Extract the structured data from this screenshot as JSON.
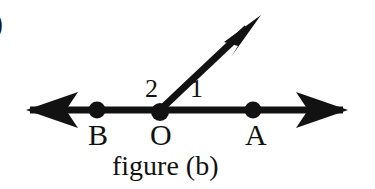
{
  "figure": {
    "caption": "figure (b)",
    "corner_mark": ")",
    "background_color": "#ffffff",
    "ink_color": "#121212",
    "points": [
      {
        "id": "B",
        "label": "B",
        "x": 97,
        "y": 110
      },
      {
        "id": "O",
        "label": "O",
        "x": 160,
        "y": 110
      },
      {
        "id": "A",
        "label": "A",
        "x": 253,
        "y": 110
      }
    ],
    "angles": [
      {
        "id": "1",
        "label": "1",
        "description": "angle between ray OA and the slanted ray"
      },
      {
        "id": "2",
        "label": "2",
        "description": "angle between ray OB and the slanted ray"
      }
    ],
    "lines": [
      {
        "id": "line-BA",
        "name": "horizontal-double-arrow-line",
        "x1": 28,
        "y1": 110,
        "x2": 345,
        "y2": 110,
        "stroke_width": 7,
        "arrow_start": true,
        "arrow_end": true
      },
      {
        "id": "ray-O-up",
        "name": "slanted-ray",
        "x1": 160,
        "y1": 110,
        "x2": 258,
        "y2": 18,
        "stroke_width": 7,
        "arrow_start": false,
        "arrow_end": true
      }
    ],
    "dot_radius": 8
  }
}
